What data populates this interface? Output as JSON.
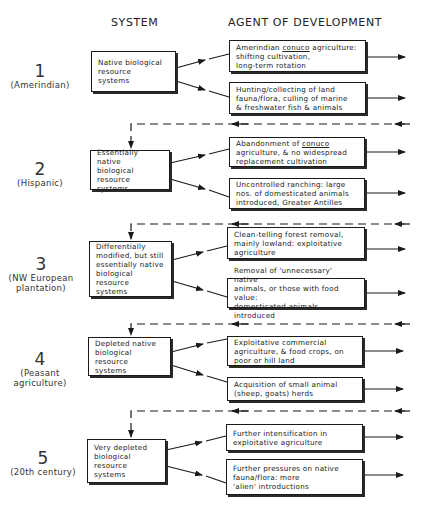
{
  "headers": {
    "system": "SYSTEM",
    "agent": "AGENT OF DEVELOPMENT"
  },
  "stages": [
    {
      "number": "1",
      "period": "(Amerindian)",
      "system": "Native biological resource systems",
      "agents": [
        "Amerindian conuco agriculture: shifting cultivation, long-term rotation",
        "Hunting/collecting of land fauna/flora, culling of marine & freshwater fish & animals"
      ]
    },
    {
      "number": "2",
      "period": "(Hispanic)",
      "system": "Essentially native biological resource systems",
      "agents": [
        "Abandonment of conuco agriculture, & no widespread replacement cultivation",
        "Uncontrolled ranching: large nos. of domesticated animals introduced, Greater Antilles"
      ]
    },
    {
      "number": "3",
      "period": "(NW European plantation)",
      "system": "Differentially modified, but still essentially native biological resource systems",
      "agents": [
        "Clean-telling forest removal, mainly lowland: exploitative agriculture",
        "Removal of 'unnecessary' native animals, or those with food value: domesticated animals introduced"
      ]
    },
    {
      "number": "4",
      "period": "(Peasant agriculture)",
      "system": "Depleted native biological resource systems",
      "agents": [
        "Exploitative commercial agriculture, & food crops, on poor or hill land",
        "Acquisition of small animal (sheep, goats) herds"
      ]
    },
    {
      "number": "5",
      "period": "(20th century)",
      "system": "Very depleted biological resource systems",
      "agents": [
        "Further intensification in exploitative agriculture",
        "Further pressures on native fauna/flora: more 'alien' introductions"
      ]
    }
  ],
  "text_lines": {
    "s1_sys": [
      "Native biological",
      "resource",
      "systems"
    ],
    "s1_a1": [
      "Amerindian ",
      "conuco",
      " agriculture:",
      "shifting cultivation,",
      "long-term rotation"
    ],
    "s1_a2": [
      "Hunting/collecting of land",
      "fauna/flora, culling of marine",
      "& freshwater fish & animals"
    ],
    "s2_sys": [
      "Essentially native",
      "biological resource",
      "systems"
    ],
    "s2_a1": [
      "Abandonment of ",
      "conuco",
      "agriculture, & no widespread",
      "replacement cultivation"
    ],
    "s2_a2": [
      "Uncontrolled ranching: large",
      "nos. of domesticated animals",
      "introduced, Greater Antilles"
    ],
    "s3_sys": [
      "Differentially",
      "modified, but still",
      "essentially native",
      "biological resource",
      "systems"
    ],
    "s3_a1": [
      "Clean-telling forest removal,",
      "mainly lowland: exploitative",
      "agriculture"
    ],
    "s3_a2": [
      "Removal of 'unnecessary' native",
      "animals, or those with food value:",
      "domesticated animals introduced"
    ],
    "s4_sys": [
      "Depleted native",
      "biological resource",
      "systems"
    ],
    "s4_a1": [
      "Exploitative commercial",
      "agriculture, & food crops, on",
      "poor or hill land"
    ],
    "s4_a2": [
      "Acquisition of small animal",
      "(sheep, goats) herds"
    ],
    "s5_sys": [
      "Very depleted",
      "biological resource",
      "systems"
    ],
    "s5_a1": [
      "Further intensification in",
      "exploitative agriculture"
    ],
    "s5_a2": [
      "Further pressures on native",
      "fauna/flora: more",
      "'alien' introductions"
    ]
  }
}
